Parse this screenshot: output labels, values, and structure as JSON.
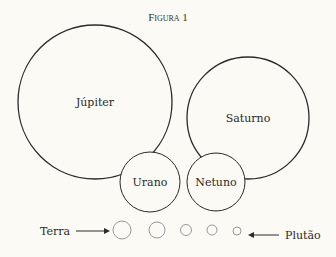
{
  "figure": {
    "title": "Figura 1",
    "planets": [
      {
        "name": "Júpiter",
        "cx": 95,
        "cy": 102,
        "r": 77
      },
      {
        "name": "Saturno",
        "cx": 248,
        "cy": 118,
        "r": 61
      },
      {
        "name": "Urano",
        "cx": 150,
        "cy": 182,
        "r": 30
      },
      {
        "name": "Netuno",
        "cx": 216,
        "cy": 182,
        "r": 29
      }
    ],
    "small_planets": [
      {
        "cx": 122,
        "cy": 230,
        "r": 9
      },
      {
        "cx": 157,
        "cy": 230,
        "r": 8
      },
      {
        "cx": 186,
        "cy": 230,
        "r": 5.5
      },
      {
        "cx": 212,
        "cy": 230,
        "r": 5
      },
      {
        "cx": 237,
        "cy": 231,
        "r": 4
      }
    ],
    "annotations": {
      "left_label": "Terra",
      "right_label": "Plutão"
    },
    "colors": {
      "background": "#fbfaf5",
      "stroke": "#2a2a2a",
      "small_stroke": "#999999"
    }
  }
}
